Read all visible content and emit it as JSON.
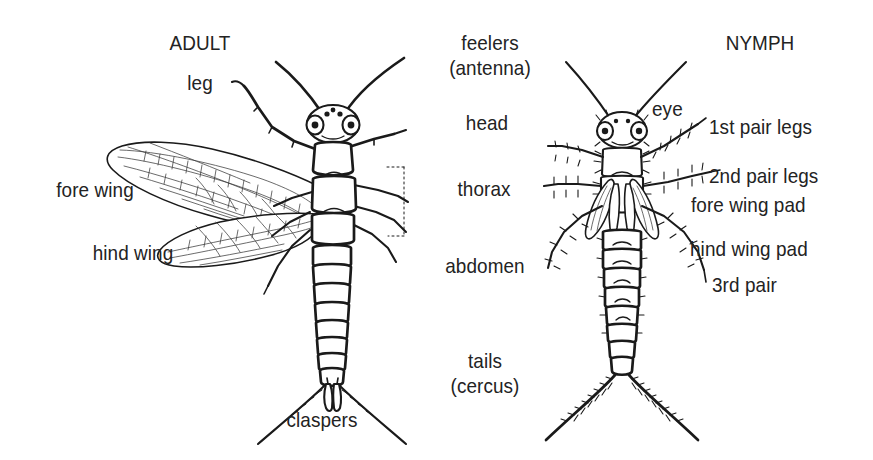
{
  "figure": {
    "background_color": "#ffffff",
    "ink_color": "#1a1a1a",
    "text_color": "#232323"
  },
  "panels": {
    "left": {
      "title": "ADULT"
    },
    "right": {
      "title": "NYMPH"
    }
  },
  "labels": {
    "adult_title": "ADULT",
    "nymph_title": "NYMPH",
    "leg": "leg",
    "fore_wing": "fore wing",
    "hind_wing": "hind wing",
    "claspers": "claspers",
    "feelers_line1": "feelers",
    "feelers_line2": "(antenna)",
    "head": "head",
    "thorax": "thorax",
    "abdomen": "abdomen",
    "tails_line1": "tails",
    "tails_line2": "(cercus)",
    "eye": "eye",
    "first_pair_legs": "1st pair legs",
    "second_pair_legs": "2nd pair legs",
    "fore_wing_pad": "fore wing pad",
    "hind_wing_pad": "hind wing pad",
    "third_pair": "3rd pair"
  }
}
